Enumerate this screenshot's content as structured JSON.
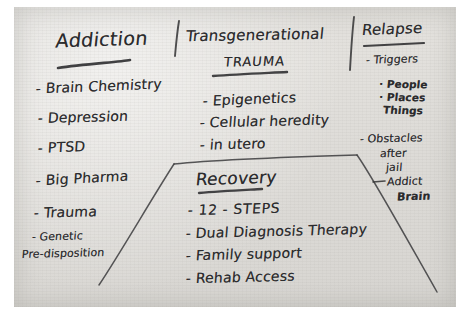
{
  "board": {
    "medium": "handwritten-paper-mindmap",
    "ink_color": "#2b2b2d",
    "paper_color": "#dedcd8"
  },
  "columns": [
    {
      "id": "addiction",
      "heading": "Addiction",
      "underlined": true,
      "items": [
        "- Brain Chemistry",
        "- Depression",
        "- PTSD",
        "- Big Pharma",
        "- Trauma",
        "- Genetic",
        "Pre-disposition"
      ]
    },
    {
      "id": "transgenerational-trauma",
      "heading": "Transgenerational",
      "subheading": "TRAUMA",
      "underlined": true,
      "items": [
        "- Epigenetics",
        "- Cellular heredity",
        "- in utero"
      ]
    },
    {
      "id": "relapse",
      "heading": "Relapse",
      "underlined": true,
      "items": [
        "- Triggers"
      ],
      "subitems": [
        "· People",
        "· Places",
        "Things"
      ],
      "items2": [
        "- Obstacles",
        "after",
        "jail"
      ],
      "items3": [
        "Addict",
        "Brain"
      ]
    }
  ],
  "recovery_box": {
    "id": "recovery",
    "heading": "Recovery",
    "underlined": true,
    "items": [
      "- 12 - STEPS",
      "- Dual Diagnosis Therapy",
      "- Family support",
      "- Rehab Access"
    ]
  },
  "dividers": {
    "divider_1_label": "vertical-rule-addiction-trauma",
    "divider_2_label": "vertical-rule-trauma-relapse"
  }
}
